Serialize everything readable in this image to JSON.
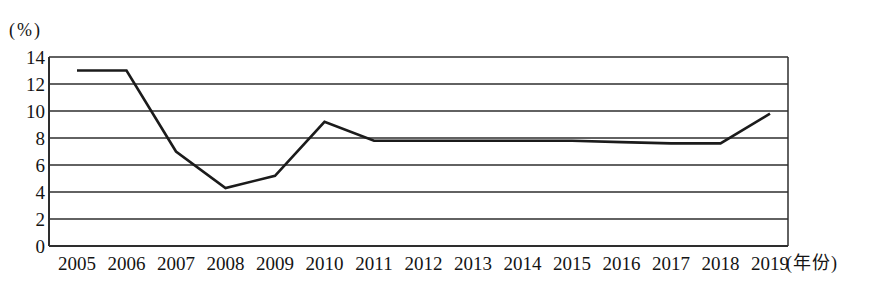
{
  "chart_data": {
    "type": "line",
    "title": "",
    "x": [
      2005,
      2006,
      2007,
      2008,
      2009,
      2010,
      2011,
      2012,
      2013,
      2014,
      2015,
      2016,
      2017,
      2018,
      2019
    ],
    "values": [
      13,
      13,
      7,
      4.3,
      5.2,
      9.2,
      7.8,
      7.8,
      7.8,
      7.8,
      7.8,
      7.7,
      7.6,
      7.6,
      9.8
    ],
    "y_unit_label": "(%)",
    "x_unit_label": "(年份)",
    "ylim": [
      0,
      14
    ],
    "yticks": [
      0,
      2,
      4,
      6,
      8,
      10,
      12,
      14
    ],
    "grid": "horizontal",
    "legend": "none",
    "line_color": "#1b1b1b",
    "grid_color": "#2e2e2e",
    "background_color": "#ffffff"
  }
}
